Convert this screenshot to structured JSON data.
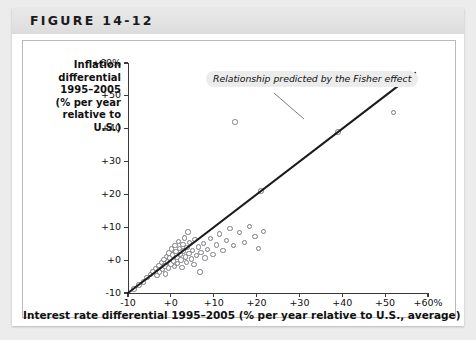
{
  "figure": {
    "label": "FIGURE 14-12"
  },
  "chart_data": {
    "type": "scatter",
    "title": "FIGURE 14-12",
    "ylabel_lines": [
      "Inflation",
      "differential",
      "1995–2005",
      "(% per year",
      "relative to",
      "U.S.)"
    ],
    "xlabel": "Interest rate differential 1995–2005 (% per year relative to U.S., average)",
    "xlim": [
      -10,
      60
    ],
    "ylim": [
      -10,
      60
    ],
    "xticks": [
      -10,
      0,
      10,
      20,
      30,
      40,
      50,
      60
    ],
    "yticks": [
      -10,
      0,
      10,
      20,
      30,
      40,
      50,
      60
    ],
    "xtick_labels": [
      "-10",
      "+0",
      "+10",
      "+20",
      "+30",
      "+40",
      "+50",
      "+60%"
    ],
    "ytick_labels": [
      "-10",
      "+0",
      "+10",
      "+20",
      "+30",
      "+40",
      "+50",
      "+60%"
    ],
    "grid": false,
    "legend": null,
    "annotations": [
      {
        "text": "Relationship predicted by the Fisher effect",
        "x": 12,
        "y": 55
      }
    ],
    "reference_line": {
      "label": "Relationship predicted by the Fisher effect",
      "slope": 1,
      "intercept": 0,
      "from": [
        -10,
        -10
      ],
      "to": [
        57,
        57
      ],
      "color": "#1c1c1c"
    },
    "marker": {
      "shape": "open-circle",
      "edge_color": "#7c7c82",
      "fill_color": "#ffffff"
    },
    "points": [
      {
        "x": -8.6,
        "y": -8.8
      },
      {
        "x": -7.4,
        "y": -7.6
      },
      {
        "x": -6.4,
        "y": -6.6
      },
      {
        "x": -5.6,
        "y": -5.2
      },
      {
        "x": -4.8,
        "y": -4.4
      },
      {
        "x": -4.2,
        "y": -3.4
      },
      {
        "x": -3.6,
        "y": -2.6
      },
      {
        "x": -3.2,
        "y": -4.6
      },
      {
        "x": -2.8,
        "y": -1.6
      },
      {
        "x": -2.6,
        "y": -3.6
      },
      {
        "x": -2.2,
        "y": -0.8
      },
      {
        "x": -2.0,
        "y": -2.8
      },
      {
        "x": -1.6,
        "y": 0.2
      },
      {
        "x": -1.4,
        "y": -1.8
      },
      {
        "x": -1.2,
        "y": -4.2
      },
      {
        "x": -1.0,
        "y": 1.2
      },
      {
        "x": -0.8,
        "y": -0.6
      },
      {
        "x": -0.6,
        "y": -2.4
      },
      {
        "x": -0.4,
        "y": 2.2
      },
      {
        "x": -0.2,
        "y": 0.6
      },
      {
        "x": 0.0,
        "y": -1.2
      },
      {
        "x": 0.2,
        "y": 3.4
      },
      {
        "x": 0.4,
        "y": 1.6
      },
      {
        "x": 0.6,
        "y": -0.2
      },
      {
        "x": 0.8,
        "y": -2.0
      },
      {
        "x": 1.0,
        "y": 4.4
      },
      {
        "x": 1.2,
        "y": 2.6
      },
      {
        "x": 1.4,
        "y": 0.8
      },
      {
        "x": 1.6,
        "y": -1.0
      },
      {
        "x": 1.8,
        "y": 5.6
      },
      {
        "x": 2.0,
        "y": 3.6
      },
      {
        "x": 2.2,
        "y": 1.8
      },
      {
        "x": 2.4,
        "y": 0.0
      },
      {
        "x": 2.6,
        "y": -2.2
      },
      {
        "x": 2.8,
        "y": 4.8
      },
      {
        "x": 3.0,
        "y": 2.8
      },
      {
        "x": 3.2,
        "y": 6.8
      },
      {
        "x": 3.4,
        "y": 1.0
      },
      {
        "x": 3.6,
        "y": -0.8
      },
      {
        "x": 3.8,
        "y": 3.8
      },
      {
        "x": 4.0,
        "y": 8.6
      },
      {
        "x": 4.2,
        "y": 2.0
      },
      {
        "x": 4.4,
        "y": 5.4
      },
      {
        "x": 4.8,
        "y": 0.4
      },
      {
        "x": 5.0,
        "y": 3.0
      },
      {
        "x": 5.4,
        "y": -1.4
      },
      {
        "x": 5.6,
        "y": 6.2
      },
      {
        "x": 6.0,
        "y": 1.4
      },
      {
        "x": 6.4,
        "y": 4.0
      },
      {
        "x": 6.8,
        "y": -3.6
      },
      {
        "x": 7.0,
        "y": 2.4
      },
      {
        "x": 7.6,
        "y": 5.0
      },
      {
        "x": 8.0,
        "y": 0.6
      },
      {
        "x": 8.6,
        "y": 3.2
      },
      {
        "x": 9.2,
        "y": 6.6
      },
      {
        "x": 9.8,
        "y": 1.8
      },
      {
        "x": 10.6,
        "y": 4.6
      },
      {
        "x": 11.4,
        "y": 8.0
      },
      {
        "x": 12.2,
        "y": 3.0
      },
      {
        "x": 13.0,
        "y": 6.0
      },
      {
        "x": 13.8,
        "y": 9.6
      },
      {
        "x": 14.6,
        "y": 4.4
      },
      {
        "x": 15.0,
        "y": 42.0
      },
      {
        "x": 16.0,
        "y": 8.4
      },
      {
        "x": 17.2,
        "y": 5.4
      },
      {
        "x": 18.4,
        "y": 10.2
      },
      {
        "x": 19.6,
        "y": 7.2
      },
      {
        "x": 20.4,
        "y": 3.6
      },
      {
        "x": 21.0,
        "y": 21.0
      },
      {
        "x": 21.6,
        "y": 8.8
      },
      {
        "x": 39.0,
        "y": 39.0
      },
      {
        "x": 52.0,
        "y": 45.0
      }
    ]
  }
}
